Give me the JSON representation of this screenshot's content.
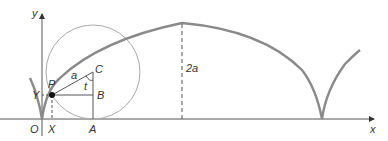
{
  "diagram": {
    "labels": {
      "y_axis": "y",
      "x_axis": "x",
      "origin": "O",
      "point_p": "P",
      "point_x": "X",
      "point_y": "Y",
      "point_a": "A",
      "point_b": "B",
      "point_c": "C",
      "radius": "a",
      "angle": "t",
      "height": "2a"
    },
    "colors": {
      "curve": "#8a8a8a",
      "circle": "#a8a8a8",
      "axis": "#555555",
      "text": "#333333"
    }
  }
}
